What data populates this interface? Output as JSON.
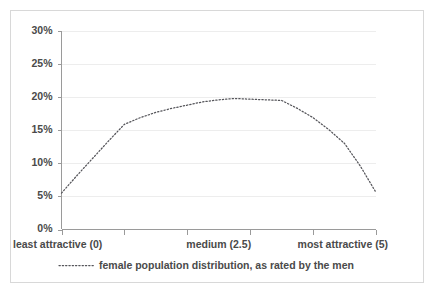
{
  "chart_data": {
    "type": "line",
    "title": "",
    "subtitle": "",
    "xlabel": "",
    "ylabel": "",
    "xlim": [
      0,
      5
    ],
    "ylim": [
      0,
      30
    ],
    "grid": true,
    "legend_position": "bottom",
    "y_ticks": [
      0,
      5,
      10,
      15,
      20,
      25,
      30
    ],
    "y_tick_labels": [
      "0%",
      "5%",
      "10%",
      "15%",
      "20%",
      "25%",
      "30%"
    ],
    "x_ticks": [
      0,
      1,
      2,
      3,
      4,
      5
    ],
    "x_tick_labels": [
      "",
      "",
      "",
      "",
      "",
      ""
    ],
    "x_axis_annotations": [
      {
        "value": 0,
        "label": "least attractive (0)",
        "align": "left"
      },
      {
        "value": 2.5,
        "label": "medium (2.5)",
        "align": "center"
      },
      {
        "value": 5,
        "label": "most attractive (5)",
        "align": "right"
      }
    ],
    "series": [
      {
        "name": "female population distribution, as rated by the men",
        "style": "dotted",
        "color": "#55555a",
        "x": [
          0,
          0.25,
          0.5,
          0.75,
          1,
          1.25,
          1.5,
          1.75,
          2,
          2.25,
          2.5,
          2.75,
          3,
          3.25,
          3.5,
          3.75,
          4,
          4.25,
          4.5,
          4.75,
          5
        ],
        "values": [
          5.5,
          8.2,
          10.8,
          13.4,
          15.9,
          16.9,
          17.7,
          18.3,
          18.8,
          19.3,
          19.6,
          19.8,
          19.7,
          19.6,
          19.5,
          18.3,
          16.9,
          15.1,
          13.0,
          9.6,
          5.6
        ]
      }
    ]
  },
  "legend": {
    "entries": [
      {
        "label": "female population distribution, as rated by the men"
      }
    ]
  },
  "colors": {
    "series": "#55555a",
    "axis": "#9a9a9a",
    "grid": "#ededed",
    "text": "#4a4a4a",
    "border": "#d8d8d8",
    "background": "#ffffff"
  }
}
